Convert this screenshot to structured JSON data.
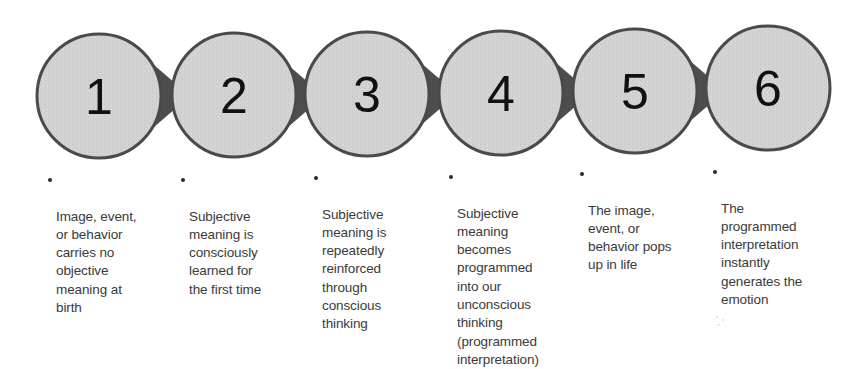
{
  "diagram": {
    "type": "process-flow",
    "colors": {
      "circle_fill": "#d2d2d2",
      "circle_stroke": "#4a4a4a",
      "arrow_fill": "#4d4d4d",
      "number_text": "#111111",
      "description_text": "#3a3a3a"
    },
    "steps": [
      {
        "number": "1",
        "description": "Image, event,\nor behavior\ncarries no\nobjective\nmeaning at\nbirth"
      },
      {
        "number": "2",
        "description": "Subjective\nmeaning is\nconsciously\nlearned for\nthe first time"
      },
      {
        "number": "3",
        "description": "Subjective\nmeaning is\nrepeatedly\nreinforced\nthrough\nconscious\nthinking"
      },
      {
        "number": "4",
        "description": "Subjective\nmeaning\nbecomes\nprogrammed\ninto our\nunconscious\nthinking\n(programmed\ninterpretation)"
      },
      {
        "number": "5",
        "description": "The image,\nevent, or\nbehavior pops\nup in life"
      },
      {
        "number": "6",
        "description": "The\nprogrammed\ninterpretation\ninstantly\ngenerates the\nemotion"
      }
    ]
  }
}
